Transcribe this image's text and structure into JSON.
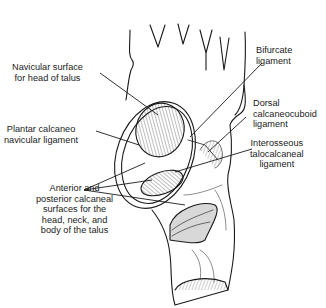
{
  "diagram": {
    "labels": [
      {
        "id": "navicular",
        "line1": "Navicular surface",
        "line2": "for head of talus"
      },
      {
        "id": "bifurcate",
        "line1": "Bifurcate",
        "line2": "ligament"
      },
      {
        "id": "dorsal",
        "line1": "Dorsal",
        "line2": "calcaneocuboid",
        "line3": "ligament"
      },
      {
        "id": "plantar",
        "line1": "Plantar calcaneo",
        "line2": "navicular ligament"
      },
      {
        "id": "interosseous",
        "line1": "Interosseous",
        "line2": "talocalcaneal",
        "line3": "ligament"
      },
      {
        "id": "calcaneal",
        "line1": "Anterior and",
        "line2": "posterior calcaneal",
        "line3": "surfaces for the",
        "line4": "head, neck, and",
        "line5": "body of the talus"
      }
    ]
  }
}
